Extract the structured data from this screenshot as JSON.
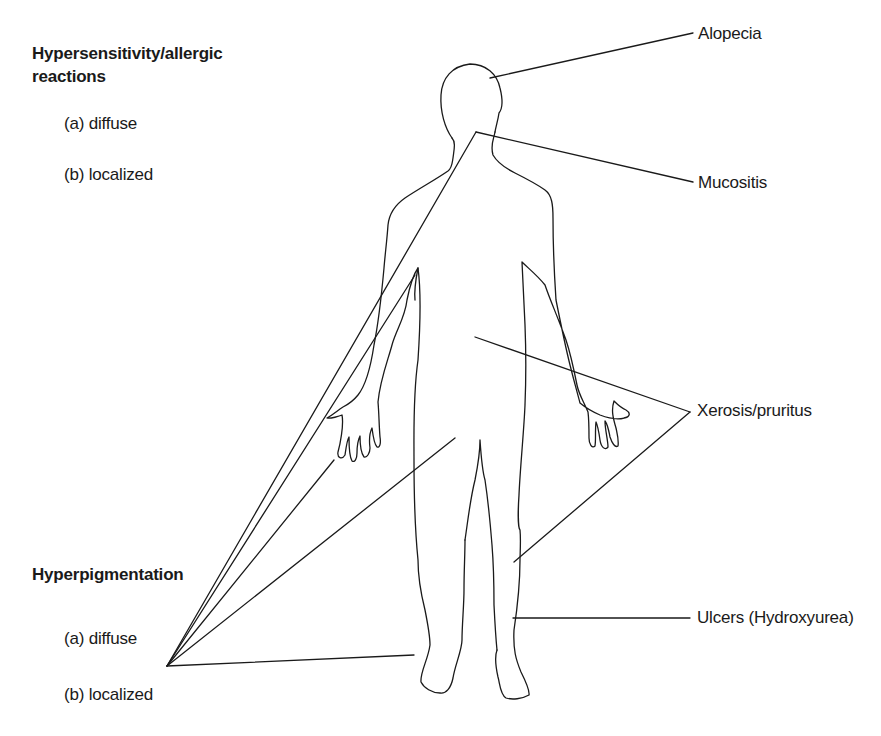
{
  "diagram": {
    "left_groups": [
      {
        "title_line1": "Hypersensitivity/allergic",
        "title_line2": "reactions",
        "items": [
          "(a) diffuse",
          "(b) localized"
        ]
      },
      {
        "title_line1": "Hyperpigmentation",
        "items": [
          "(a) diffuse",
          "(b) localized"
        ]
      }
    ],
    "right_labels": {
      "alopecia": "Alopecia",
      "mucositis": "Mucositis",
      "xerosis": "Xerosis/pruritus",
      "ulcers": "Ulcers (Hydroxyurea)"
    },
    "line_color": "#1a1a1a",
    "background": "#ffffff"
  }
}
